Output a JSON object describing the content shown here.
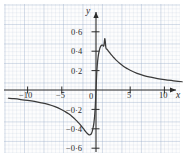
{
  "figure": {
    "background_color": "#ffffff",
    "paper_color": "#fdfdfd",
    "grid_color": "#96aac8",
    "curve_color": "#3a3a3a",
    "axis_color": "#2b2b2b"
  },
  "axes": {
    "x_axis_name": "x",
    "y_axis_name": "y",
    "origin_label": "0",
    "x_ticks": [
      {
        "value": -10,
        "label": "−10"
      },
      {
        "value": -5,
        "label": "−5"
      },
      {
        "value": 5,
        "label": "5"
      },
      {
        "value": 10,
        "label": "10"
      }
    ],
    "y_ticks": [
      {
        "value": 0.6,
        "label": "0·6"
      },
      {
        "value": 0.4,
        "label": "0·4"
      },
      {
        "value": 0.2,
        "label": "0·2"
      },
      {
        "value": -0.2,
        "label": "−0·2"
      },
      {
        "value": -0.4,
        "label": "−0·4"
      },
      {
        "value": -0.6,
        "label": "−0·6"
      }
    ]
  },
  "chart_data": {
    "type": "line",
    "title": "",
    "subtitle": "",
    "xlabel": "x",
    "ylabel": "y",
    "xlim": [
      -12.8,
      12.6
    ],
    "ylim": [
      -0.78,
      0.78
    ],
    "grid": true,
    "legend": null,
    "annotations": [],
    "series": [
      {
        "name": "curve",
        "color": "#3a3a3a",
        "description": "odd-symmetric peaked decay curve, maximum near x = 1.3 (y = 0.53), minimum near x = -1.3 (y = -0.53), tends to 0 as |x| grows",
        "x": [
          -12.8,
          -12.0,
          -11.0,
          -10.0,
          -9.0,
          -8.0,
          -7.0,
          -6.0,
          -5.0,
          -4.5,
          -4.0,
          -3.5,
          -3.0,
          -2.75,
          -2.5,
          -2.25,
          -2.0,
          -1.8,
          -1.6,
          -1.45,
          -1.3,
          -1.15,
          -1.0,
          -0.85,
          -0.7,
          -0.55,
          -0.4,
          -0.3,
          -0.2,
          -0.1,
          0.0,
          0.1,
          0.2,
          0.3,
          0.4,
          0.55,
          0.7,
          0.85,
          1.0,
          1.15,
          1.3,
          1.45,
          1.6,
          1.8,
          2.0,
          2.25,
          2.5,
          2.75,
          3.0,
          3.5,
          4.0,
          4.5,
          5.0,
          6.0,
          7.0,
          8.0,
          9.0,
          10.0,
          11.0,
          12.0,
          12.6
        ],
        "y": [
          -0.085,
          -0.09,
          -0.098,
          -0.107,
          -0.118,
          -0.132,
          -0.149,
          -0.172,
          -0.203,
          -0.223,
          -0.246,
          -0.273,
          -0.305,
          -0.323,
          -0.342,
          -0.362,
          -0.384,
          -0.402,
          -0.421,
          -0.434,
          -0.446,
          -0.456,
          -0.462,
          -0.462,
          -0.452,
          -0.427,
          -0.38,
          -0.336,
          -0.268,
          -0.163,
          0.0,
          0.163,
          0.268,
          0.336,
          0.38,
          0.427,
          0.452,
          0.462,
          0.462,
          0.456,
          0.53,
          0.434,
          0.421,
          0.402,
          0.384,
          0.362,
          0.342,
          0.323,
          0.305,
          0.273,
          0.246,
          0.223,
          0.203,
          0.172,
          0.149,
          0.132,
          0.118,
          0.107,
          0.098,
          0.09,
          0.085
        ]
      }
    ],
    "features": {
      "maximum": {
        "x": 1.3,
        "y": 0.53
      },
      "minimum": {
        "x": -1.3,
        "y": -0.53
      },
      "zero_crossing": {
        "x": 0,
        "y": 0
      },
      "horizontal_asymptote": 0
    }
  }
}
